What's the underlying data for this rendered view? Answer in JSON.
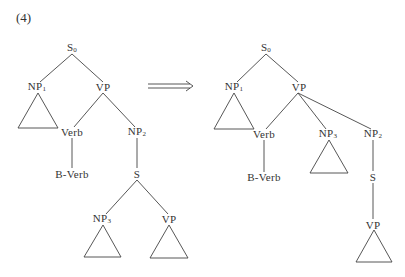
{
  "example_number": "(4)",
  "arrow": "double-right-arrow",
  "left_tree": {
    "nodes": [
      {
        "id": "S0",
        "label": "S",
        "sub": "0",
        "x": 72,
        "y": 48
      },
      {
        "id": "NP1",
        "label": "NP",
        "sub": "1",
        "x": 37,
        "y": 87
      },
      {
        "id": "VP",
        "label": "VP",
        "sub": "",
        "x": 103,
        "y": 87
      },
      {
        "id": "Verb",
        "label": "Verb",
        "sub": "",
        "x": 72,
        "y": 132
      },
      {
        "id": "NP2",
        "label": "NP",
        "sub": "2",
        "x": 137,
        "y": 132
      },
      {
        "id": "BVerb",
        "label": "B-Verb",
        "sub": "",
        "x": 72,
        "y": 174
      },
      {
        "id": "S",
        "label": "S",
        "sub": "",
        "x": 137,
        "y": 174
      },
      {
        "id": "NP3",
        "label": "NP",
        "sub": "3",
        "x": 102,
        "y": 219
      },
      {
        "id": "VP2",
        "label": "VP",
        "sub": "",
        "x": 169,
        "y": 219
      }
    ]
  },
  "right_tree": {
    "nodes": [
      {
        "id": "S0",
        "label": "S",
        "sub": "0",
        "x": 266,
        "y": 48
      },
      {
        "id": "NP1",
        "label": "NP",
        "sub": "1",
        "x": 234,
        "y": 87
      },
      {
        "id": "VP",
        "label": "VP",
        "sub": "",
        "x": 299,
        "y": 87
      },
      {
        "id": "Verb",
        "label": "Verb",
        "sub": "",
        "x": 264,
        "y": 134
      },
      {
        "id": "NP3",
        "label": "NP",
        "sub": "3",
        "x": 328,
        "y": 134
      },
      {
        "id": "NP2",
        "label": "NP",
        "sub": "2",
        "x": 373,
        "y": 134
      },
      {
        "id": "BVerb",
        "label": "B-Verb",
        "sub": "",
        "x": 264,
        "y": 177
      },
      {
        "id": "S",
        "label": "S",
        "sub": "",
        "x": 373,
        "y": 177
      },
      {
        "id": "VP2",
        "label": "VP",
        "sub": "",
        "x": 373,
        "y": 225
      }
    ]
  }
}
